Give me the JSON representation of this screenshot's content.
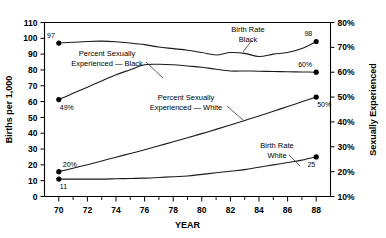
{
  "chart_data": {
    "type": "line",
    "title": "",
    "xlabel": "YEAR",
    "ylabel": "Births per 1,000",
    "y2label": "Sexually Experienced",
    "xlim": [
      69,
      89
    ],
    "ylim": [
      0,
      110
    ],
    "y2lim": [
      10,
      80
    ],
    "grid": false,
    "legend": "annotations-inline",
    "x_ticks": [
      "70",
      "72",
      "74",
      "76",
      "78",
      "80",
      "82",
      "84",
      "86",
      "88"
    ],
    "x_tick_values": [
      70,
      72,
      74,
      76,
      78,
      80,
      82,
      84,
      86,
      88
    ],
    "x_minor_ticks": [
      71,
      73,
      75,
      77,
      79,
      81,
      83,
      85,
      87
    ],
    "y_ticks": [
      "0",
      "10",
      "20",
      "30",
      "40",
      "50",
      "60",
      "70",
      "80",
      "90",
      "100",
      "110"
    ],
    "y_tick_values": [
      0,
      10,
      20,
      30,
      40,
      50,
      60,
      70,
      80,
      90,
      100,
      110
    ],
    "y2_ticks": [
      "10%",
      "20%",
      "30%",
      "40%",
      "50%",
      "60%",
      "70%",
      "80%"
    ],
    "y2_tick_values": [
      10,
      20,
      30,
      40,
      50,
      60,
      70,
      80
    ],
    "x": [
      70,
      71,
      72,
      73,
      74,
      75,
      76,
      77,
      78,
      79,
      80,
      81,
      82,
      83,
      84,
      85,
      86,
      87,
      88
    ],
    "series": [
      {
        "name": "Birth Rate Black",
        "axis": "left",
        "units": "births per 1,000",
        "values": [
          97,
          97.5,
          98,
          98.2,
          97.8,
          97,
          96,
          94.5,
          93.5,
          92.5,
          91,
          89.5,
          91,
          90.5,
          88.5,
          90,
          91,
          93.5,
          98
        ],
        "endpoint_labels": [
          {
            "x": 70,
            "value": 97,
            "text": "97",
            "position": "above-left"
          },
          {
            "x": 88,
            "value": 98,
            "text": "98",
            "position": "above-left"
          }
        ],
        "annotation": {
          "line1": "Birth Rate",
          "line2": "Black"
        }
      },
      {
        "name": "Percent Sexually Experienced — Black",
        "axis": "right",
        "units": "percent",
        "values": [
          49,
          51.5,
          54,
          56.5,
          59,
          61,
          63,
          63.2,
          63,
          62.5,
          62,
          61.2,
          60.5,
          60.5,
          60.4,
          60.3,
          60.2,
          60.1,
          60
        ],
        "endpoint_labels": [
          {
            "x": 70,
            "value": 49,
            "text": "49%",
            "position": "below-right"
          },
          {
            "x": 88,
            "value": 60,
            "text": "60%",
            "position": "above-left"
          }
        ],
        "annotation": {
          "line1": "Percent Sexually",
          "line2": "Experienced — Black"
        }
      },
      {
        "name": "Percent Sexually Experienced — White",
        "axis": "right",
        "units": "percent",
        "values": [
          20,
          21.4,
          22.8,
          24.3,
          25.8,
          27.3,
          28.8,
          30.4,
          32,
          33.6,
          35.3,
          37,
          38.8,
          40.6,
          42.4,
          44.3,
          46.2,
          48.1,
          50
        ],
        "endpoint_labels": [
          {
            "x": 70,
            "value": 20,
            "text": "20%",
            "position": "above-right"
          },
          {
            "x": 88,
            "value": 50,
            "text": "50%",
            "position": "below-right"
          }
        ],
        "annotation": {
          "line1": "Percent Sexually",
          "line2": "Experienced — White"
        }
      },
      {
        "name": "Birth Rate White",
        "axis": "left",
        "units": "births per 1,000",
        "values": [
          11,
          11,
          11,
          11,
          11.2,
          11.4,
          11.6,
          12,
          12.5,
          13,
          14,
          15,
          16,
          17,
          18.5,
          20,
          21.5,
          23,
          25
        ],
        "endpoint_labels": [
          {
            "x": 70,
            "value": 11,
            "text": "11",
            "position": "below-right"
          },
          {
            "x": 88,
            "value": 25,
            "text": "25",
            "position": "below-left"
          }
        ],
        "annotation": {
          "line1": "Birth Rate",
          "line2": "White"
        }
      }
    ],
    "annotations": [
      {
        "id": "birth-rate-black",
        "line1": "Birth Rate",
        "line2": "Black",
        "x_px": 248,
        "y_px": 32
      },
      {
        "id": "pct-sex-exp-black",
        "line1": "Percent Sexually",
        "line2": "Experienced — Black",
        "x_px": 107,
        "y_px": 56
      },
      {
        "id": "pct-sex-exp-white",
        "line1": "Percent Sexually",
        "line2": "Experienced — White",
        "x_px": 186,
        "y_px": 100
      },
      {
        "id": "birth-rate-white",
        "line1": "Birth Rate",
        "line2": "White",
        "x_px": 277,
        "y_px": 148
      }
    ]
  }
}
